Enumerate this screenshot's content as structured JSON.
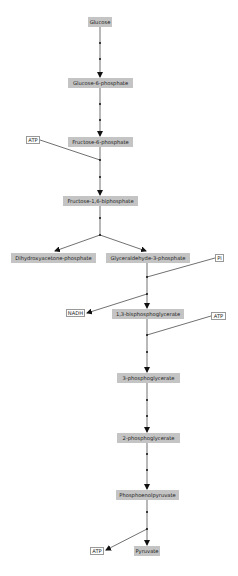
{
  "diagram": {
    "metabolites": [
      {
        "id": "glucose",
        "label": "Glucose",
        "x": 88,
        "y": 17,
        "w": 24
      },
      {
        "id": "g6p",
        "label": "Glucose-6-phosphate",
        "x": 68,
        "y": 78,
        "w": 65
      },
      {
        "id": "f6p",
        "label": "Fructose-6-phosphate",
        "x": 68,
        "y": 137,
        "w": 65
      },
      {
        "id": "f16bp",
        "label": "Fructose-1,6-biphosphate",
        "x": 63,
        "y": 196,
        "w": 75
      },
      {
        "id": "dhap",
        "label": "Dihydroxyacetone-phosphate",
        "x": 11,
        "y": 253,
        "w": 85
      },
      {
        "id": "gap",
        "label": "Glyceraldehyde-3-phosphate",
        "x": 106,
        "y": 253,
        "w": 84
      },
      {
        "id": "bpg13",
        "label": "1,3-bisphosphoglycerate",
        "x": 112,
        "y": 309,
        "w": 72
      },
      {
        "id": "pg3",
        "label": "3-phosphoglycerate",
        "x": 117,
        "y": 373,
        "w": 63
      },
      {
        "id": "pg2",
        "label": "2-phosphoglycerate",
        "x": 117,
        "y": 433,
        "w": 63
      },
      {
        "id": "pep",
        "label": "Phosphoenolpyruvate",
        "x": 116,
        "y": 490,
        "w": 63
      },
      {
        "id": "pyruvate",
        "label": "Pyruvate",
        "x": 134,
        "y": 546,
        "w": 26
      }
    ],
    "cofactors": [
      {
        "id": "atp1",
        "label": "ATP",
        "x": 26,
        "y": 136,
        "w": 14
      },
      {
        "id": "pi",
        "label": "Pi",
        "x": 215,
        "y": 254,
        "w": 9
      },
      {
        "id": "nadh",
        "label": "NADH",
        "x": 66,
        "y": 309,
        "w": 19
      },
      {
        "id": "atp2",
        "label": "ATP",
        "x": 211,
        "y": 312,
        "w": 15
      },
      {
        "id": "atp3",
        "label": "ATP",
        "x": 90,
        "y": 547,
        "w": 14
      }
    ]
  }
}
